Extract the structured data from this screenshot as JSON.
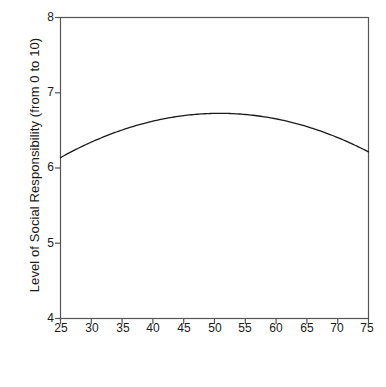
{
  "chart_data": {
    "type": "line",
    "title": "",
    "xlabel": "Respondent Age",
    "ylabel": "Level of Social Responsibility (from 0 to 10)",
    "xlim": [
      25,
      75
    ],
    "ylim": [
      4,
      8
    ],
    "xticks": [
      25,
      30,
      35,
      40,
      45,
      50,
      55,
      60,
      65,
      70,
      75
    ],
    "yticks": [
      4,
      5,
      6,
      7,
      8
    ],
    "grid": false,
    "legend": null,
    "series": [
      {
        "name": "Predicted level of social responsibility",
        "x": [
          25,
          30,
          35,
          40,
          45,
          50,
          52,
          55,
          60,
          65,
          70,
          75
        ],
        "values": [
          6.13,
          6.34,
          6.51,
          6.63,
          6.71,
          6.73,
          6.73,
          6.71,
          6.64,
          6.53,
          6.39,
          6.24
        ]
      }
    ],
    "annotations": [],
    "curve_shape": "inverted-U (quadratic), peak near age 51",
    "line_color": "#1a1a1a",
    "axis_color": "#555555"
  },
  "axes": {
    "x_tick_labels": [
      "25",
      "30",
      "35",
      "40",
      "45",
      "50",
      "55",
      "60",
      "65",
      "70",
      "75"
    ],
    "y_tick_labels": [
      "4",
      "5",
      "6",
      "7",
      "8"
    ],
    "x_axis_title": "Respondent Age",
    "y_axis_title": "Level of Social Responsibility (from 0 to 10)"
  }
}
